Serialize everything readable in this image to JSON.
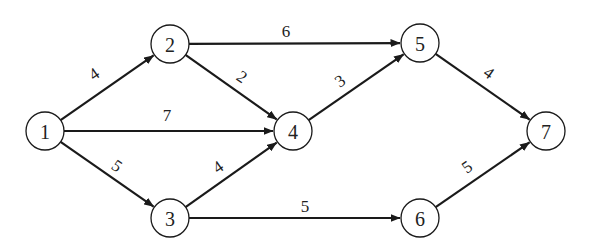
{
  "diagram": {
    "type": "directed-network",
    "node_radius": 19,
    "colors": {
      "stroke": "#1a1a1a",
      "fill": "#ffffff",
      "text": "#222222"
    },
    "nodes": [
      {
        "id": "1",
        "label": "1",
        "x": 45,
        "y": 131
      },
      {
        "id": "2",
        "label": "2",
        "x": 170,
        "y": 44
      },
      {
        "id": "3",
        "label": "3",
        "x": 170,
        "y": 218
      },
      {
        "id": "4",
        "label": "4",
        "x": 293,
        "y": 131
      },
      {
        "id": "5",
        "label": "5",
        "x": 420,
        "y": 43
      },
      {
        "id": "6",
        "label": "6",
        "x": 420,
        "y": 218
      },
      {
        "id": "7",
        "label": "7",
        "x": 546,
        "y": 131
      }
    ],
    "edges": [
      {
        "from": "1",
        "to": "2",
        "weight": "4",
        "lx": 94,
        "ly": 74,
        "rot": -35
      },
      {
        "from": "1",
        "to": "4",
        "weight": "7",
        "lx": 167,
        "ly": 115,
        "rot": 0
      },
      {
        "from": "1",
        "to": "3",
        "weight": "5",
        "lx": 117,
        "ly": 166,
        "rot": 35
      },
      {
        "from": "2",
        "to": "5",
        "weight": "6",
        "lx": 286,
        "ly": 31,
        "rot": 0
      },
      {
        "from": "2",
        "to": "4",
        "weight": "2",
        "lx": 242,
        "ly": 77,
        "rot": 35
      },
      {
        "from": "3",
        "to": "4",
        "weight": "4",
        "lx": 218,
        "ly": 167,
        "rot": -35
      },
      {
        "from": "3",
        "to": "6",
        "weight": "5",
        "lx": 305,
        "ly": 206,
        "rot": 0
      },
      {
        "from": "4",
        "to": "5",
        "weight": "3",
        "lx": 340,
        "ly": 81,
        "rot": -35
      },
      {
        "from": "5",
        "to": "7",
        "weight": "4",
        "lx": 489,
        "ly": 73,
        "rot": 35
      },
      {
        "from": "6",
        "to": "7",
        "weight": "5",
        "lx": 467,
        "ly": 167,
        "rot": -35
      }
    ]
  }
}
